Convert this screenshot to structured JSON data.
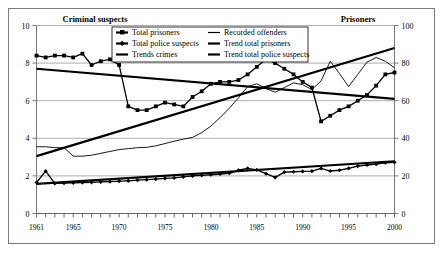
{
  "headers": {
    "left_title": "Criminal suspects",
    "right_title": "Prisoners"
  },
  "legend": {
    "items": [
      {
        "label": "Total prisoners",
        "marker": "square-line",
        "color": "#000000"
      },
      {
        "label": "Recorded offenders",
        "marker": "thin-line",
        "color": "#000000"
      },
      {
        "label": "Total police suspects",
        "marker": "diamond-line",
        "color": "#000000"
      },
      {
        "label": "Trend total prisoners",
        "marker": "thick-line",
        "color": "#000000"
      },
      {
        "label": "Trends crimes",
        "marker": "thick-line",
        "color": "#000000"
      },
      {
        "label": "Trend total police suspects",
        "marker": "thick-line",
        "color": "#000000"
      }
    ]
  },
  "chart_data": {
    "type": "line",
    "title": "",
    "xlabel": "",
    "ylabel": "Criminal suspects",
    "y2label": "Prisoners",
    "grid": true,
    "legend_position": "top-center",
    "xlim": [
      1961,
      2000
    ],
    "ylim": [
      0,
      10
    ],
    "y2lim": [
      0,
      100
    ],
    "yticks": [
      0,
      2,
      4,
      6,
      8,
      10
    ],
    "y2ticks": [
      0,
      20,
      40,
      60,
      80,
      100
    ],
    "xticks": [
      1961,
      1965,
      1970,
      1975,
      1980,
      1985,
      1990,
      1995,
      2000
    ],
    "x": [
      1961,
      1962,
      1963,
      1964,
      1965,
      1966,
      1967,
      1968,
      1969,
      1970,
      1971,
      1972,
      1973,
      1974,
      1975,
      1976,
      1977,
      1978,
      1979,
      1980,
      1981,
      1982,
      1983,
      1984,
      1985,
      1986,
      1987,
      1988,
      1989,
      1990,
      1991,
      1992,
      1993,
      1994,
      1995,
      1996,
      1997,
      1998,
      1999,
      2000
    ],
    "series": [
      {
        "name": "Total prisoners",
        "axis": "right",
        "marker": "square",
        "values": [
          84,
          83,
          84,
          84,
          83,
          85,
          79,
          81,
          82,
          79,
          57,
          55,
          55,
          57,
          59,
          58,
          57,
          62,
          65,
          69,
          70,
          70,
          71,
          74,
          78,
          82,
          80,
          77,
          74,
          70,
          67,
          49,
          52,
          55,
          57,
          60,
          63,
          68,
          74,
          75
        ]
      },
      {
        "name": "Total police suspects",
        "axis": "left",
        "marker": "diamond",
        "values": [
          1.65,
          2.25,
          1.6,
          1.62,
          1.63,
          1.65,
          1.66,
          1.68,
          1.7,
          1.72,
          1.74,
          1.77,
          1.8,
          1.83,
          1.87,
          1.9,
          1.95,
          2.0,
          2.03,
          2.06,
          2.1,
          2.14,
          2.3,
          2.4,
          2.32,
          2.12,
          1.92,
          2.2,
          2.22,
          2.24,
          2.25,
          2.4,
          2.26,
          2.3,
          2.4,
          2.52,
          2.58,
          2.63,
          2.7,
          2.72
        ]
      },
      {
        "name": "Recorded offenders",
        "axis": "left",
        "marker": "none",
        "values": [
          3.55,
          3.55,
          3.5,
          3.5,
          3.05,
          3.05,
          3.1,
          3.2,
          3.3,
          3.4,
          3.45,
          3.5,
          3.52,
          3.6,
          3.72,
          3.85,
          3.95,
          4.05,
          4.3,
          4.65,
          5.1,
          5.6,
          6.15,
          6.75,
          6.9,
          6.65,
          6.45,
          6.7,
          6.95,
          6.85,
          6.6,
          7.05,
          8.1,
          7.45,
          6.75,
          7.4,
          8.05,
          8.3,
          8.1,
          7.75
        ]
      }
    ],
    "trends": [
      {
        "name": "Trend total prisoners",
        "axis": "right",
        "x": [
          1961,
          2000
        ],
        "values": [
          77,
          61
        ]
      },
      {
        "name": "Trends crimes",
        "axis": "left",
        "x": [
          1961,
          2000
        ],
        "values": [
          3.05,
          8.8
        ]
      },
      {
        "name": "Trend total police suspects",
        "axis": "left",
        "x": [
          1961,
          2000
        ],
        "values": [
          1.58,
          2.78
        ]
      }
    ]
  }
}
